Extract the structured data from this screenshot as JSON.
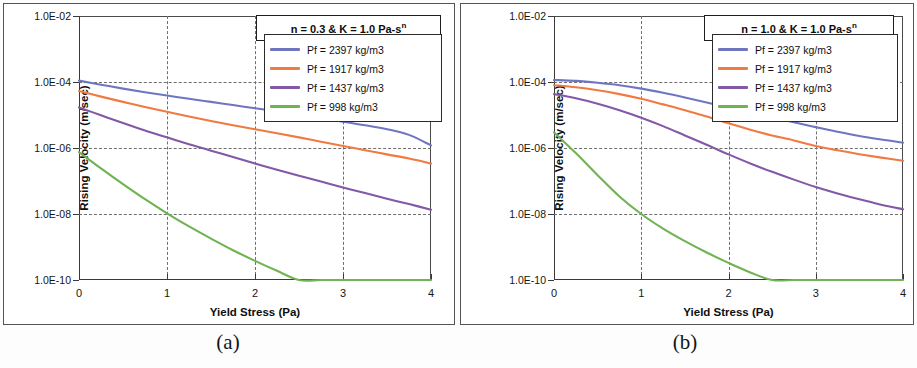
{
  "figure": {
    "panels": [
      {
        "id": "a",
        "caption": "(a)",
        "title_prefix": "n = 0.3  &  K = 1.0 Pa-s",
        "title_sup": "n"
      },
      {
        "id": "b",
        "caption": "(b)",
        "title_prefix": "n = 1.0  &  K = 1.0 Pa-s",
        "title_sup": "n"
      }
    ],
    "legend_series_colors": {
      "2397": "#6f76c0",
      "1917": "#f07a40",
      "1437": "#8358a6",
      "998": "#6fb352"
    }
  },
  "chart_data": [
    {
      "type": "line",
      "panel": "a",
      "title": "n = 0.3  &  K = 1.0 Pa-sn",
      "xlabel": "Yield Stress (Pa)",
      "ylabel": "Rising Velocity  (m/sec)",
      "xlim": [
        0,
        4
      ],
      "ylim": [
        1e-10,
        0.01
      ],
      "yscale": "log",
      "xticks": [
        0,
        1,
        2,
        3,
        4
      ],
      "xticklabels": [
        "0",
        "1",
        "2",
        "3",
        "4"
      ],
      "yticks": [
        0.01,
        0.0001,
        1e-06,
        1e-08,
        1e-10
      ],
      "yticklabels": [
        "1.0E-02",
        "1.0E-04",
        "1.0E-06",
        "1.0E-08",
        "1.0E-10"
      ],
      "grid": "both-dashed",
      "legend_position": "upper-right",
      "x": [
        0,
        0.25,
        0.5,
        0.75,
        1,
        1.25,
        1.5,
        1.75,
        2,
        2.25,
        2.5,
        2.75,
        3,
        3.25,
        3.5,
        3.75,
        4
      ],
      "series": [
        {
          "name": "Pf  = 2397 kg/m3",
          "color": "#6f76c0",
          "values": [
            0.00011,
            8.3e-05,
            6.3e-05,
            4.9e-05,
            3.9e-05,
            3.1e-05,
            2.5e-05,
            2e-05,
            1.6e-05,
            1.3e-05,
            1e-05,
            8e-06,
            6.3e-06,
            4.9e-06,
            3.7e-06,
            2.5e-06,
            1.2e-06
          ]
        },
        {
          "name": "Pf  = 1917 kg/m3",
          "color": "#f07a40",
          "values": [
            5.3e-05,
            3.6e-05,
            2.5e-05,
            1.75e-05,
            1.25e-05,
            9e-06,
            6.6e-06,
            4.9e-06,
            3.7e-06,
            2.8e-06,
            2.1e-06,
            1.55e-06,
            1.15e-06,
            8.6e-07,
            6.4e-07,
            4.8e-07,
            3.4e-07
          ]
        },
        {
          "name": "Pf  = 1437 kg/m3",
          "color": "#8358a6",
          "values": [
            1.7e-05,
            9.8e-06,
            5.7e-06,
            3.4e-06,
            2.1e-06,
            1.3e-06,
            8.3e-07,
            5.3e-07,
            3.4e-07,
            2.2e-07,
            1.45e-07,
            9.6e-08,
            6.4e-08,
            4.3e-08,
            2.9e-08,
            2e-08,
            1.35e-08
          ]
        },
        {
          "name": "Pf  = 998 kg/m3",
          "color": "#6fb352",
          "values": [
            7.5e-07,
            2.4e-07,
            8e-08,
            2.8e-08,
            1.05e-08,
            4.2e-09,
            1.8e-09,
            8e-10,
            3.8e-10,
            1.9e-10,
            1e-10,
            5.6e-11,
            3.2e-11,
            1.9e-11,
            1.2e-11,
            7.5e-12,
            5e-12
          ]
        }
      ]
    },
    {
      "type": "line",
      "panel": "b",
      "title": "n = 1.0  &  K = 1.0 Pa-sn",
      "xlabel": "Yield Stress (Pa)",
      "ylabel": "Rising Velocity  (m/sec)",
      "xlim": [
        0,
        4
      ],
      "ylim": [
        1e-10,
        0.01
      ],
      "yscale": "log",
      "xticks": [
        0,
        1,
        2,
        3,
        4
      ],
      "xticklabels": [
        "0",
        "1",
        "2",
        "3",
        "4"
      ],
      "yticks": [
        0.01,
        0.0001,
        1e-06,
        1e-08,
        1e-10
      ],
      "yticklabels": [
        "1.0E-02",
        "1.0E-04",
        "1.0E-06",
        "1.0E-08",
        "1.0E-10"
      ],
      "grid": "both-dashed",
      "legend_position": "upper-right",
      "x": [
        0,
        0.25,
        0.5,
        0.75,
        1,
        1.25,
        1.5,
        1.75,
        2,
        2.25,
        2.5,
        2.75,
        3,
        3.25,
        3.5,
        3.75,
        4
      ],
      "series": [
        {
          "name": "Pf  = 2397 kg/m3",
          "color": "#6f76c0",
          "values": [
            0.000115,
            0.000108,
            9.5e-05,
            8e-05,
            6.3e-05,
            4.7e-05,
            3.4e-05,
            2.4e-05,
            1.7e-05,
            1.2e-05,
            8.5e-06,
            6e-06,
            4.3e-06,
            3.1e-06,
            2.3e-06,
            1.8e-06,
            1.45e-06
          ]
        },
        {
          "name": "Pf  = 1917 kg/m3",
          "color": "#f07a40",
          "values": [
            8e-05,
            6.9e-05,
            5.6e-05,
            4.3e-05,
            3.1e-05,
            2.1e-05,
            1.4e-05,
            9e-06,
            5.6e-06,
            3.6e-06,
            2.4e-06,
            1.7e-06,
            1.15e-06,
            8.5e-07,
            6.5e-07,
            5.1e-07,
            4.1e-07
          ]
        },
        {
          "name": "Pf  = 1437 kg/m3",
          "color": "#8358a6",
          "values": [
            4.3e-05,
            3.2e-05,
            2.2e-05,
            1.4e-05,
            8.3e-06,
            4.6e-06,
            2.4e-06,
            1.25e-06,
            6.4e-07,
            3.4e-07,
            1.9e-07,
            1.1e-07,
            6.6e-08,
            4.2e-08,
            2.8e-08,
            1.9e-08,
            1.4e-08
          ]
        },
        {
          "name": "Pf  = 998 kg/m3",
          "color": "#6fb352",
          "values": [
            3e-06,
            7e-07,
            1.5e-07,
            3.4e-08,
            1e-08,
            3.6e-09,
            1.5e-09,
            6.8e-10,
            3.3e-10,
            1.7e-10,
            9e-11,
            5e-11,
            2.9e-11,
            1.8e-11,
            1.15e-11,
            7.5e-12,
            5e-12
          ]
        }
      ]
    }
  ]
}
